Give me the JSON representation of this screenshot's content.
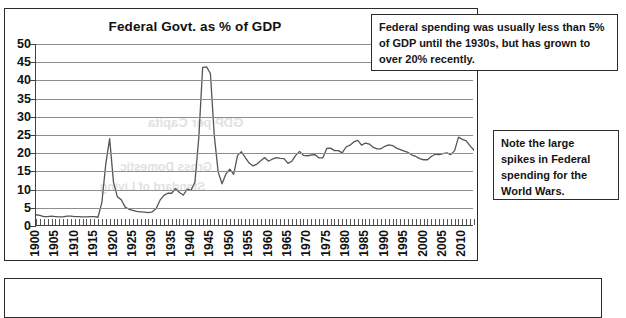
{
  "chart_card": {
    "title": "Federal Govt. as % of GDP"
  },
  "annotations": {
    "top_note": "Federal spending was usually less than 5% of GDP until the 1930s, but has grown to over 20% recently.",
    "right_note": "Note the large spikes in Federal spending for the World Wars."
  },
  "chart_data": {
    "type": "line",
    "title": "Federal Govt. as % of GDP",
    "xlabel": "",
    "ylabel": "",
    "xlim": [
      1900,
      2013
    ],
    "ylim": [
      0,
      50
    ],
    "ytick_step": 5,
    "yticks": [
      0,
      5,
      10,
      15,
      20,
      25,
      30,
      35,
      40,
      45,
      50
    ],
    "xticks_labeled": [
      1900,
      1905,
      1910,
      1915,
      1920,
      1925,
      1930,
      1935,
      1940,
      1945,
      1950,
      1955,
      1960,
      1965,
      1970,
      1975,
      1980,
      1985,
      1990,
      1995,
      2000,
      2005,
      2010
    ],
    "xtick_minor_every": 1,
    "grid": "horizontal",
    "legend": "none",
    "line_color": "#555555",
    "series": [
      {
        "name": "Federal Govt. spending as % of GDP",
        "x": [
          1900,
          1901,
          1902,
          1903,
          1904,
          1905,
          1906,
          1907,
          1908,
          1909,
          1910,
          1911,
          1912,
          1913,
          1914,
          1915,
          1916,
          1917,
          1918,
          1919,
          1920,
          1921,
          1922,
          1923,
          1924,
          1925,
          1926,
          1927,
          1928,
          1929,
          1930,
          1931,
          1932,
          1933,
          1934,
          1935,
          1936,
          1937,
          1938,
          1939,
          1940,
          1941,
          1942,
          1943,
          1944,
          1945,
          1946,
          1947,
          1948,
          1949,
          1950,
          1951,
          1952,
          1953,
          1954,
          1955,
          1956,
          1957,
          1958,
          1959,
          1960,
          1961,
          1962,
          1963,
          1964,
          1965,
          1966,
          1967,
          1968,
          1969,
          1970,
          1971,
          1972,
          1973,
          1974,
          1975,
          1976,
          1977,
          1978,
          1979,
          1980,
          1981,
          1982,
          1983,
          1984,
          1985,
          1986,
          1987,
          1988,
          1989,
          1990,
          1991,
          1992,
          1993,
          1994,
          1995,
          1996,
          1997,
          1998,
          1999,
          2000,
          2001,
          2002,
          2003,
          2004,
          2005,
          2006,
          2007,
          2008,
          2009,
          2010,
          2011,
          2012,
          2013
        ],
        "values": [
          3.1,
          2.9,
          2.6,
          2.6,
          2.7,
          2.6,
          2.5,
          2.5,
          2.7,
          2.7,
          2.6,
          2.6,
          2.5,
          2.5,
          2.6,
          2.6,
          2.4,
          6.5,
          17.0,
          24.0,
          12.0,
          8.0,
          7.2,
          5.2,
          4.6,
          4.3,
          4.0,
          3.9,
          3.8,
          3.7,
          3.9,
          4.8,
          7.1,
          8.4,
          9.0,
          9.0,
          10.3,
          9.2,
          8.5,
          10.1,
          9.8,
          12.0,
          24.3,
          43.6,
          43.7,
          41.9,
          24.8,
          14.8,
          11.6,
          14.3,
          15.6,
          14.2,
          19.4,
          20.4,
          18.8,
          17.3,
          16.5,
          17.0,
          17.9,
          18.8,
          17.8,
          18.4,
          18.8,
          18.6,
          18.5,
          17.2,
          17.8,
          19.4,
          20.5,
          19.4,
          19.3,
          19.5,
          19.6,
          18.7,
          18.7,
          21.3,
          21.4,
          20.7,
          20.7,
          20.1,
          21.7,
          22.2,
          23.1,
          23.5,
          22.2,
          22.8,
          22.5,
          21.6,
          21.2,
          21.2,
          21.9,
          22.3,
          22.1,
          21.4,
          21.0,
          20.6,
          20.2,
          19.5,
          19.1,
          18.5,
          18.2,
          18.2,
          19.1,
          19.7,
          19.6,
          19.9,
          20.1,
          19.6,
          20.7,
          24.4,
          23.8,
          23.4,
          22.0,
          20.8
        ]
      }
    ]
  }
}
